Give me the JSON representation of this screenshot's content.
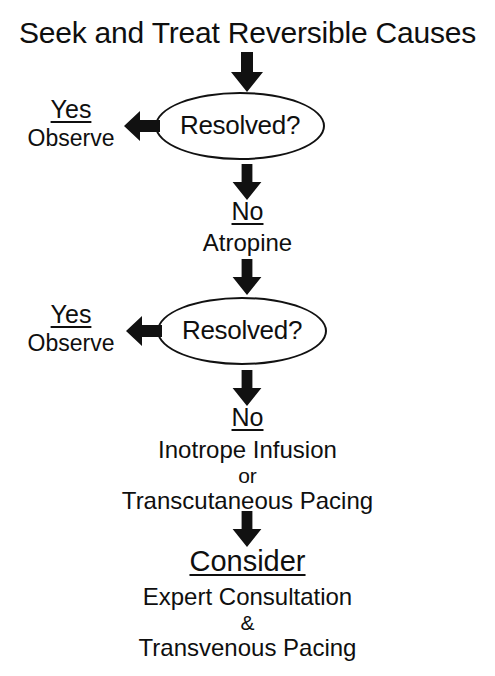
{
  "diagram": {
    "title": "Seek and Treat Reversible Causes",
    "nodes": {
      "decision_1": "Resolved?",
      "decision_2": "Resolved?"
    },
    "branches": [
      {
        "key": "Yes",
        "action": "Observe"
      },
      {
        "key": "Yes",
        "action": "Observe"
      }
    ],
    "steps": [
      {
        "key": "No",
        "lines": [
          "Atropine"
        ]
      },
      {
        "key": "No",
        "lines": [
          "Inotrope Infusion",
          "or",
          "Transcutaneous Pacing"
        ]
      },
      {
        "key": "Consider",
        "lines": [
          "Expert Consultation",
          "&",
          "Transvenous Pacing"
        ]
      }
    ],
    "icons": {
      "arrow_down": "arrow-down-icon",
      "arrow_left": "arrow-left-icon"
    },
    "colors": {
      "ink": "#111111",
      "background": "#ffffff"
    }
  }
}
